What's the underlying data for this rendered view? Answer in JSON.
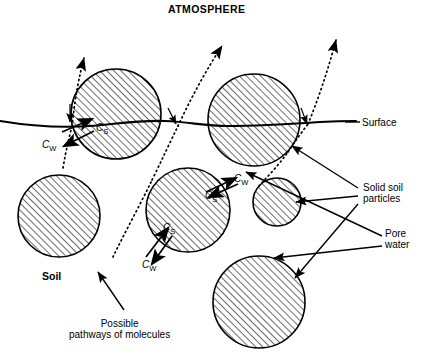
{
  "diagram": {
    "title": "ATMOSPHERE",
    "soil_label": "Soil",
    "surface_label": "Surface",
    "solid_particles_label": "Solid soil\nparticles",
    "pore_water_label": "Pore\nwater",
    "pathways_caption": "Possible\npathways of molecules",
    "concentration_labels": {
      "sorbed": "C",
      "sorbed_sub": "S",
      "water": "C",
      "water_sub": "W"
    },
    "colors": {
      "ink": "#000000",
      "background": "#ffffff"
    },
    "particles": [
      {
        "name": "particle-top-left",
        "cx": 116,
        "cy": 114,
        "r": 45
      },
      {
        "name": "particle-top-right",
        "cx": 254,
        "cy": 120,
        "r": 46
      },
      {
        "name": "particle-left",
        "cx": 59,
        "cy": 216,
        "r": 41
      },
      {
        "name": "particle-center",
        "cx": 188,
        "cy": 210,
        "r": 42
      },
      {
        "name": "particle-small-right",
        "cx": 277,
        "cy": 202,
        "r": 24
      },
      {
        "name": "particle-bottom-right",
        "cx": 259,
        "cy": 302,
        "r": 46
      }
    ],
    "pathway_count": 3,
    "equilibrium_pairs": 3
  }
}
